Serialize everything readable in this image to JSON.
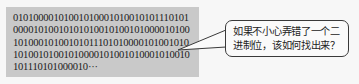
{
  "binary_box": {
    "lines": [
      "01010000101001010001010010101110101",
      "00001010010101010010100101000010100",
      "10100010100101011101010000101001010",
      "10100101001010000101001010001010010",
      "101110101000010···"
    ],
    "background_color": "#c9c9c9"
  },
  "speech_bubble": {
    "text": "如果不小心弄错了一个二进制位，该如何找出来？"
  }
}
